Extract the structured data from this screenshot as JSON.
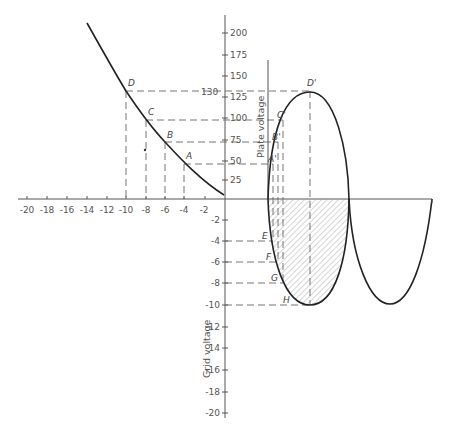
{
  "figure": {
    "x_axis": {
      "ticks": [
        "-20",
        "-18",
        "-16",
        "-14",
        "-12",
        "-10",
        "-8",
        "-6",
        "-4",
        "-2"
      ]
    },
    "y_axis_plate": {
      "label": "Plate voltage",
      "ticks": [
        "200",
        "175",
        "150",
        "125",
        "100",
        "75",
        "50",
        "25"
      ],
      "marker_value": "130"
    },
    "y_axis_grid": {
      "label": "Grid voltage",
      "ticks": [
        "-2",
        "-4",
        "-6",
        "-8",
        "-10",
        "-12",
        "-14",
        "-16",
        "-18",
        "-20"
      ]
    },
    "curve_points": [
      {
        "label": "D",
        "grid": -10,
        "plate": 130
      },
      {
        "label": "C",
        "grid": -8,
        "plate": 100
      },
      {
        "label": "B",
        "grid": -6,
        "plate": 75
      },
      {
        "label": "A",
        "grid": -4,
        "plate": 45
      }
    ],
    "output_points": [
      "D'",
      "C'",
      "B'",
      "A'"
    ],
    "input_points": [
      "E",
      "F",
      "G",
      "H"
    ]
  },
  "labels": {
    "D": "D",
    "C": "C",
    "B": "B",
    "A": "A",
    "Dp": "D'",
    "Cp": "C'",
    "Bp": "B'",
    "Ap": "A'",
    "E": "E",
    "F": "F",
    "G": "G",
    "H": "H",
    "v130": "130",
    "plate": "Plate voltage",
    "grid": "Grid voltage"
  },
  "ticks": {
    "x": [
      "-20",
      "-18",
      "-16",
      "-14",
      "-12",
      "-10",
      "-8",
      "-6",
      "-4",
      "-2"
    ],
    "yp": [
      "200",
      "175",
      "150",
      "125",
      "100",
      "75",
      "50",
      "25"
    ],
    "yn": [
      "-2",
      "-4",
      "-6",
      "-8",
      "-10",
      "-12",
      "-14",
      "-16",
      "-18",
      "-20"
    ]
  }
}
